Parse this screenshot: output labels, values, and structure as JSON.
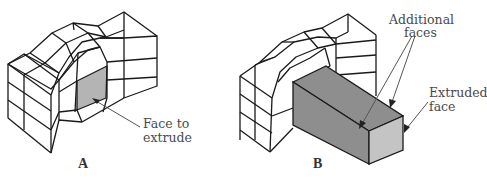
{
  "figure": {
    "panels": [
      {
        "id": "A",
        "label": "A",
        "description": "Hexahedral mesh block with one face selected for extrusion",
        "annotations": [
          {
            "text_line1": "Face to",
            "text_line2": "extrude"
          }
        ]
      },
      {
        "id": "B",
        "label": "B",
        "description": "Same mesh block after the selected face has been extruded into a rectangular prism",
        "annotations": [
          {
            "text_line1": "Additional",
            "text_line2": "faces"
          },
          {
            "text_line1": "Extruded",
            "text_line2": "face"
          }
        ]
      }
    ],
    "colors": {
      "line": "#1a1a1a",
      "selected_face": "#b4b4b4",
      "extrusion_side": "#8e8e8e",
      "extruded_end_face": "#c4c4c4",
      "annotation_text": "#4a4a4a",
      "background": "#ffffff"
    }
  }
}
